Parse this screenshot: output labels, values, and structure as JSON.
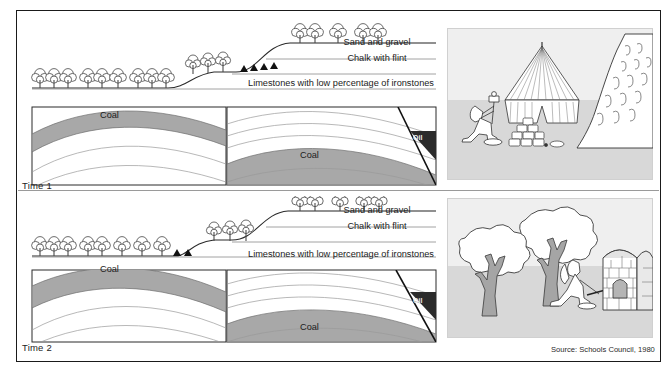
{
  "figure": {
    "source_note": "Source: Schools Council, 1980",
    "frame_color": "#1a1a1a"
  },
  "colors": {
    "coal_fill": "#a8a8a8",
    "rock_line": "#8a8a8a",
    "oil_fill": "#2b2b2b",
    "ground_band": "#d9d9d9",
    "tree_trunk": "#9b9b9b",
    "panel_bg": "#efefef",
    "text": "#1b1b1b"
  },
  "panels": [
    {
      "id": "time-1",
      "time_label": "Time 1",
      "strata_labels": [
        {
          "id": "sand-and-gravel",
          "text": "Sand and gravel"
        },
        {
          "id": "chalk-with-flint",
          "text": "Chalk with flint"
        },
        {
          "id": "limestones",
          "text": "Limestones with low percentage of ironstones"
        }
      ],
      "deposits": [
        {
          "id": "coal-left",
          "text": "Coal"
        },
        {
          "id": "coal-right",
          "text": "Coal"
        },
        {
          "id": "oil",
          "text": "Oil"
        }
      ]
    },
    {
      "id": "time-2",
      "time_label": "Time 2",
      "strata_labels": [
        {
          "id": "sand-and-gravel",
          "text": "Sand and gravel"
        },
        {
          "id": "chalk-with-flint",
          "text": "Chalk with flint"
        },
        {
          "id": "limestones",
          "text": "Limestones with low percentage of ironstones"
        }
      ],
      "deposits": [
        {
          "id": "coal-left",
          "text": "Coal"
        },
        {
          "id": "coal-right",
          "text": "Coal"
        },
        {
          "id": "oil",
          "text": "Oil"
        }
      ]
    }
  ],
  "illustrations": [
    {
      "id": "illustration-top",
      "scene": "prehistoric-camp",
      "elements": [
        "kneeling-figure-with-tool",
        "conical-tent",
        "stone-pile",
        "rock-face-with-carvings"
      ]
    },
    {
      "id": "illustration-bottom",
      "scene": "woodland-kiln",
      "elements": [
        "broadleaf-tree",
        "broadleaf-tree",
        "kneeling-figure",
        "stone-kiln-with-fire"
      ]
    }
  ]
}
